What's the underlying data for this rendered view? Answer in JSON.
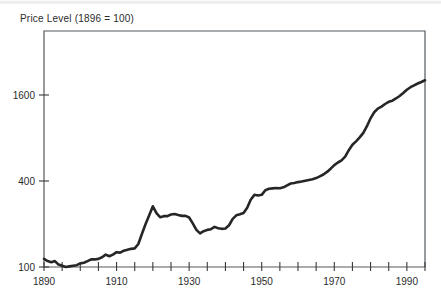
{
  "figure": {
    "title": "Price Level (1896 = 100)"
  },
  "chart_data": {
    "type": "line",
    "title": "Price Level (1896 = 100)",
    "xlabel": "",
    "ylabel": "",
    "yscale": "log",
    "ylim": [
      100,
      3200
    ],
    "xlim": [
      1890,
      1995
    ],
    "grid": false,
    "legend": null,
    "y_ticks": [
      100,
      400,
      1600
    ],
    "y_tick_labels": [
      "100",
      "400",
      "1600"
    ],
    "x_ticks": [
      1890,
      1895,
      1900,
      1905,
      1910,
      1915,
      1920,
      1925,
      1930,
      1935,
      1940,
      1945,
      1950,
      1955,
      1960,
      1965,
      1970,
      1975,
      1980,
      1985,
      1990,
      1995
    ],
    "x_tick_labels": [
      "1890",
      "",
      "",
      "",
      "1910",
      "",
      "",
      "",
      "1930",
      "",
      "",
      "",
      "1950",
      "",
      "",
      "",
      "1970",
      "",
      "",
      "",
      "1990",
      ""
    ],
    "series": [
      {
        "name": "Price Level",
        "x": [
          1890,
          1891,
          1892,
          1893,
          1894,
          1895,
          1896,
          1897,
          1898,
          1899,
          1900,
          1901,
          1902,
          1903,
          1904,
          1905,
          1906,
          1907,
          1908,
          1909,
          1910,
          1911,
          1912,
          1913,
          1914,
          1915,
          1916,
          1917,
          1918,
          1919,
          1920,
          1921,
          1922,
          1923,
          1924,
          1925,
          1926,
          1927,
          1928,
          1929,
          1930,
          1931,
          1932,
          1933,
          1934,
          1935,
          1936,
          1937,
          1938,
          1939,
          1940,
          1941,
          1942,
          1943,
          1944,
          1945,
          1946,
          1947,
          1948,
          1949,
          1950,
          1951,
          1952,
          1953,
          1954,
          1955,
          1956,
          1957,
          1958,
          1959,
          1960,
          1961,
          1962,
          1963,
          1964,
          1965,
          1966,
          1967,
          1968,
          1969,
          1970,
          1971,
          1972,
          1973,
          1974,
          1975,
          1976,
          1977,
          1978,
          1979,
          1980,
          1981,
          1982,
          1983,
          1984,
          1985,
          1986,
          1987,
          1988,
          1989,
          1990,
          1991,
          1992,
          1993,
          1994,
          1995
        ],
        "y": [
          114,
          110,
          108,
          110,
          104,
          102,
          100,
          101,
          102,
          103,
          106,
          107,
          110,
          113,
          113,
          114,
          117,
          122,
          119,
          122,
          127,
          126,
          130,
          132,
          134,
          135,
          145,
          171,
          200,
          230,
          266,
          238,
          223,
          227,
          227,
          233,
          235,
          231,
          228,
          228,
          222,
          202,
          182,
          172,
          178,
          182,
          184,
          191,
          187,
          185,
          186,
          196,
          217,
          230,
          234,
          239,
          260,
          297,
          320,
          317,
          320,
          345,
          353,
          355,
          357,
          356,
          361,
          373,
          384,
          387,
          393,
          397,
          402,
          407,
          412,
          419,
          431,
          444,
          463,
          488,
          517,
          539,
          557,
          592,
          657,
          717,
          758,
          808,
          869,
          968,
          1099,
          1212,
          1286,
          1327,
          1384,
          1433,
          1460,
          1513,
          1575,
          1651,
          1740,
          1814,
          1869,
          1925,
          1974,
          2030
        ]
      }
    ]
  },
  "axes": {
    "y_tick_labels": [
      "1600",
      "400",
      "100"
    ],
    "x_tick_labels": [
      "1890",
      "1910",
      "1930",
      "1950",
      "1970",
      "1990"
    ]
  }
}
